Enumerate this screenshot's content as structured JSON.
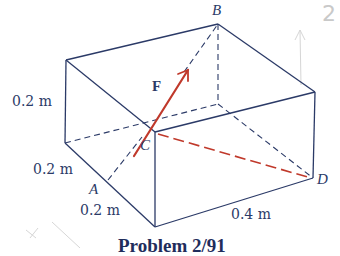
{
  "figure": {
    "caption": "Problem 2/91",
    "colors": {
      "edge": "#2b3a67",
      "force": "#c0392b",
      "pencil": "#cfcfcf"
    },
    "vertices": {
      "top_left_back": [
        66,
        60
      ],
      "B": [
        218,
        24
      ],
      "top_right": [
        315,
        92
      ],
      "C": [
        155,
        132
      ],
      "left_bottom": [
        65,
        143
      ],
      "hidden_back_bottom": [
        218,
        104
      ],
      "bottom_front": [
        155,
        227
      ],
      "D": [
        313,
        178
      ],
      "A": [
        108,
        180
      ]
    },
    "point_labels": {
      "A": "A",
      "B": "B",
      "C": "C",
      "D": "D"
    },
    "force_label": "F",
    "dimensions": {
      "height_left": "0.2 m",
      "depth_upper": "0.2 m",
      "depth_lower": "0.2 m",
      "length": "0.4 m"
    },
    "annotation": {
      "handwritten_text": "2",
      "handwritten_arrow": "↑"
    }
  }
}
